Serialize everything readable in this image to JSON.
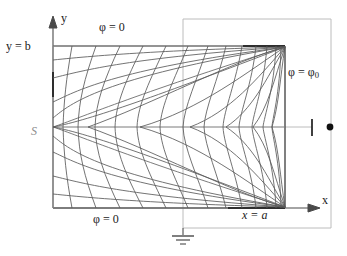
{
  "figure": {
    "type": "field-map-diagram",
    "colors": {
      "field_lines": "#4a4a4a",
      "equipotentials": "#4a4a4a",
      "boundary": "#555555",
      "circuit_wire": "#b9b9b9",
      "label_text": "#1a1a1a",
      "label_gray": "#8c8c8c",
      "background": "#ffffff"
    },
    "geometry": {
      "rect_left": 53,
      "rect_top": 46,
      "rect_right": 285,
      "rect_bottom": 208,
      "saddle_x": 53,
      "saddle_y": 127,
      "wire_left": 183,
      "wire_top": 19,
      "wire_right": 331,
      "wire_bottom": 228,
      "ground_x": 183,
      "ground_y": 228,
      "terminal_x": 312,
      "terminal_y": 127,
      "dot_x": 331,
      "dot_y": 127
    }
  },
  "labels": {
    "y_equals_b": "y = b",
    "phi_top": "φ = 0",
    "phi_bottom": "φ = 0",
    "phi_right_prefix": "φ = φ",
    "phi_right_sub": "0",
    "saddle_point": "S",
    "x_equals_a": "x = a",
    "axis_x": "x",
    "axis_y": "y"
  },
  "icons": {
    "ground_symbol": "ground-icon",
    "terminal_dot": "terminal-dot-icon",
    "x_axis_arrow": "arrow-right-icon",
    "y_axis_arrow": "arrow-up-icon"
  }
}
